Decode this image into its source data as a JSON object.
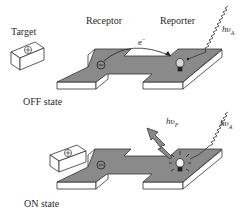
{
  "diagram": {
    "colors": {
      "platform_top": "#8a8a8a",
      "platform_side": "#ffffff",
      "outline": "#333333",
      "background": "#ffffff"
    },
    "off_state": {
      "state_label": "OFF state",
      "target_label": "Target",
      "target_symbol": "⊕",
      "receptor_label": "Receptor",
      "receptor_symbol": "⊖",
      "reporter_label": "Reporter",
      "electron_label": "e",
      "electron_charge": "−",
      "absorption_label": "hυ",
      "absorption_sub": "A",
      "reporter_icon": "lightbulb-off"
    },
    "on_state": {
      "state_label": "ON state",
      "target_symbol": "⊕",
      "receptor_symbol": "⊖",
      "absorption_label": "hυ",
      "absorption_sub": "A",
      "fluorescence_label": "hυ",
      "fluorescence_sub": "F",
      "reporter_icon": "lightbulb-on"
    }
  }
}
